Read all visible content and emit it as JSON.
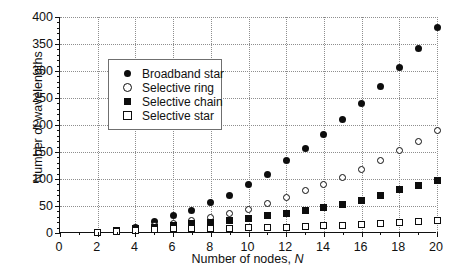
{
  "chart_data": {
    "type": "scatter",
    "title": "",
    "xlabel": "Number of nodes, N",
    "ylabel": "Number of wavelengths",
    "xlim": [
      0,
      20
    ],
    "ylim": [
      0,
      400
    ],
    "xticks": [
      0,
      2,
      4,
      6,
      8,
      10,
      12,
      14,
      16,
      18,
      20
    ],
    "yticks": [
      0,
      50,
      100,
      150,
      200,
      250,
      300,
      350,
      400
    ],
    "x_minor_step": 1,
    "y_minor_step": 10,
    "grid": "dotted-both",
    "legend_position": "upper-left-inside",
    "x": [
      2,
      3,
      4,
      5,
      6,
      7,
      8,
      9,
      10,
      11,
      12,
      13,
      14,
      15,
      16,
      17,
      18,
      19,
      20
    ],
    "series": [
      {
        "name": "Broadband star",
        "marker": "filled-circle",
        "color": "#0d0d0d",
        "values": [
          1,
          3,
          6,
          10,
          15,
          21,
          28,
          36,
          45,
          55,
          66,
          78,
          91,
          105,
          120,
          136,
          153,
          171,
          190
        ]
      },
      {
        "name": "Selective ring",
        "marker": "open-circle",
        "color": "#0d0d0d",
        "values": [
          1,
          2,
          4,
          6,
          9,
          12,
          16,
          20,
          25,
          30,
          36,
          42,
          49,
          56,
          64,
          72,
          81,
          90,
          100
        ]
      },
      {
        "name": "Selective chain",
        "marker": "filled-square",
        "color": "#0d0d0d",
        "values": [
          1,
          2,
          3,
          5,
          7,
          9,
          11,
          14,
          17,
          20,
          23,
          27,
          31,
          35,
          39,
          44,
          49,
          54,
          59
        ]
      },
      {
        "name": "Selective star",
        "marker": "open-square",
        "color": "#0d0d0d",
        "values": [
          1,
          1,
          2,
          3,
          4,
          5,
          6,
          7,
          8,
          9,
          10,
          11,
          12,
          13,
          14,
          15,
          16,
          17,
          18
        ]
      }
    ],
    "plotted": {
      "broadband_star": [
        1,
        5,
        10,
        22,
        32,
        42,
        56,
        70,
        89,
        109,
        134,
        157,
        183,
        210,
        240,
        271,
        307,
        342,
        380
      ],
      "selective_ring": [
        1,
        4,
        7,
        13,
        18,
        24,
        29,
        36,
        44,
        55,
        65,
        79,
        90,
        103,
        117,
        134,
        152,
        169,
        190
      ],
      "selective_chain": [
        1,
        4,
        8,
        11,
        13,
        17,
        19,
        23,
        27,
        32,
        36,
        41,
        47,
        53,
        61,
        70,
        80,
        88,
        98
      ],
      "selective_star": [
        1,
        2,
        4,
        6,
        8,
        8,
        9,
        9,
        10,
        10,
        11,
        12,
        13,
        14,
        15,
        17,
        19,
        21,
        23
      ]
    },
    "legend": [
      {
        "label": "Broadband star",
        "marker": "filled-circle"
      },
      {
        "label": "Selective ring",
        "marker": "open-circle"
      },
      {
        "label": "Selective chain",
        "marker": "filled-square"
      },
      {
        "label": "Selective star",
        "marker": "open-square"
      }
    ]
  },
  "axes": {
    "y_tick_labels": [
      "0",
      "50",
      "100",
      "150",
      "200",
      "250",
      "300",
      "350",
      "400"
    ],
    "x_tick_labels": [
      "0",
      "2",
      "4",
      "6",
      "8",
      "10",
      "12",
      "14",
      "16",
      "18",
      "20"
    ],
    "x_title_prefix": "Number of nodes, ",
    "x_title_symbol": "N",
    "y_title": "Number of wavelengths"
  }
}
